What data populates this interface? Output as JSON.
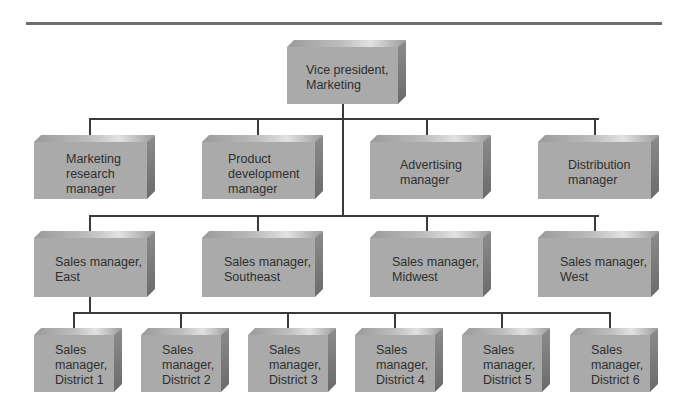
{
  "diagram": {
    "type": "org-chart",
    "colors": {
      "box_front": "#aaaaaa",
      "box_side": "#707070",
      "lines": "#3a3a3a",
      "divider": "#6e6e6e"
    },
    "root": {
      "lines": [
        "Vice president,",
        "Marketing"
      ]
    },
    "level2": [
      {
        "lines": [
          "Marketing",
          "research",
          "manager"
        ]
      },
      {
        "lines": [
          "Product",
          "development",
          "manager"
        ]
      },
      {
        "lines": [
          "Advertising",
          "manager"
        ]
      },
      {
        "lines": [
          "Distribution",
          "manager"
        ]
      }
    ],
    "level3": [
      {
        "lines": [
          "Sales manager,",
          "East"
        ]
      },
      {
        "lines": [
          "Sales manager,",
          "Southeast"
        ]
      },
      {
        "lines": [
          "Sales manager,",
          "Midwest"
        ]
      },
      {
        "lines": [
          "Sales manager,",
          "West"
        ]
      }
    ],
    "level4": [
      {
        "lines": [
          "Sales",
          "manager,",
          "District 1"
        ]
      },
      {
        "lines": [
          "Sales",
          "manager,",
          "District 2"
        ]
      },
      {
        "lines": [
          "Sales",
          "manager,",
          "District 3"
        ]
      },
      {
        "lines": [
          "Sales",
          "manager,",
          "District 4"
        ]
      },
      {
        "lines": [
          "Sales",
          "manager,",
          "District 5"
        ]
      },
      {
        "lines": [
          "Sales",
          "manager,",
          "District 6"
        ]
      }
    ]
  }
}
